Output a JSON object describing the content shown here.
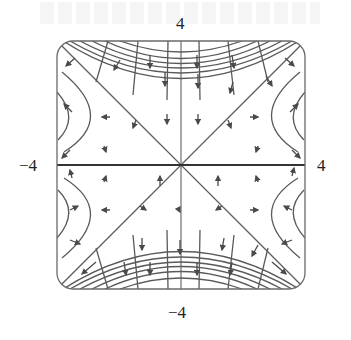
{
  "figure": {
    "type": "phase-portrait",
    "x_range": [
      -4,
      4
    ],
    "y_range": [
      -4,
      4
    ],
    "tick_labels": {
      "top": "4",
      "bottom": "−4",
      "left": "−4",
      "right": "4"
    },
    "frame": {
      "style": "rounded-square",
      "color": "#6a6a6a"
    },
    "axis_color": "#333333",
    "curve_color": "#5a5a5a",
    "separatrices": [
      "y = x",
      "y = -x"
    ],
    "top_bottom_level_curves_y_intercepts": [
      2.75,
      3.1,
      3.3,
      3.5,
      3.7,
      3.9
    ],
    "side_arcs_per_half": 2,
    "arrow_glyph": "triangle-arrow-icon"
  }
}
